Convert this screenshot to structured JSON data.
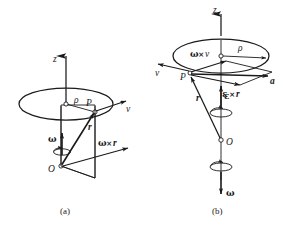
{
  "figure": {
    "background_color": "#ffffff",
    "ink_color": "#1a1a1a",
    "panels": [
      {
        "id": "a",
        "caption": "(a)",
        "description": "Point P on a circle of radius rho about the z axis; omega upward along z; v tangential; r from O to P; omega cross r shown in the shaded plane",
        "labels": {
          "axis_z": "z",
          "radius_rho": "ρ",
          "point_p": "P",
          "point_o": "O",
          "velocity": "v",
          "position_r": "r",
          "angular_velocity": "ω",
          "cross_product": "ω×r",
          "cross_symbol": "×"
        }
      },
      {
        "id": "b",
        "caption": "(b)",
        "description": "Acceleration construction at P: a is the vector sum of omega cross v and epsilon cross r; omega points downward along z; epsilon points upward",
        "labels": {
          "axis_z": "z",
          "radius_rho": "ρ",
          "point_p": "P",
          "point_o": "O",
          "velocity": "v",
          "position_r": "r",
          "angular_velocity": "ω",
          "angular_acceleration": "ε",
          "acceleration": "a",
          "omega_cross_v": "ω×v",
          "epsilon_cross_r": "ε×r",
          "cross_symbol": "×"
        }
      }
    ]
  }
}
